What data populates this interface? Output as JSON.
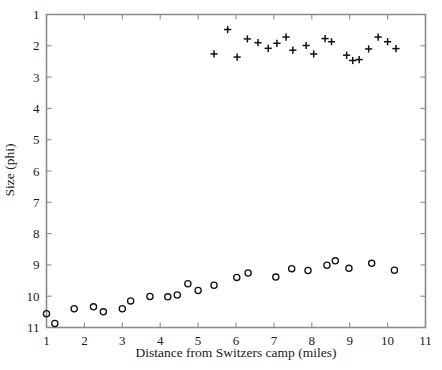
{
  "chart_data": {
    "type": "scatter",
    "title": "",
    "xlabel": "Distance from Switzers camp (miles)",
    "ylabel": "Size (phi)",
    "xlim": [
      1,
      11
    ],
    "ylim": [
      1,
      11
    ],
    "y_inverted": true,
    "grid": false,
    "legend": "none",
    "xticks": [
      1,
      2,
      3,
      4,
      5,
      6,
      7,
      8,
      9,
      10,
      11
    ],
    "xtick_labels": [
      "1",
      "2",
      "3",
      "4",
      "5",
      "6",
      "7",
      "8",
      "9",
      "10",
      "11"
    ],
    "yticks": [
      1,
      2,
      3,
      4,
      5,
      6,
      7,
      8,
      9,
      10,
      11
    ],
    "ytick_labels": [
      "1",
      "2",
      "3",
      "4",
      "5",
      "6",
      "7",
      "8",
      "9",
      "10",
      "11"
    ],
    "series": [
      {
        "name": "coarse-fraction-plus",
        "marker": "plus",
        "color": "#111111",
        "points": [
          [
            5.42,
            2.26
          ],
          [
            5.78,
            1.48
          ],
          [
            6.03,
            2.36
          ],
          [
            6.3,
            1.78
          ],
          [
            6.58,
            1.9
          ],
          [
            6.85,
            2.08
          ],
          [
            7.08,
            1.92
          ],
          [
            7.32,
            1.72
          ],
          [
            7.5,
            2.14
          ],
          [
            7.85,
            1.99
          ],
          [
            8.05,
            2.26
          ],
          [
            8.35,
            1.77
          ],
          [
            8.52,
            1.87
          ],
          [
            8.92,
            2.3
          ],
          [
            9.08,
            2.47
          ],
          [
            9.25,
            2.44
          ],
          [
            9.5,
            2.1
          ],
          [
            9.75,
            1.72
          ],
          [
            10.0,
            1.87
          ],
          [
            10.22,
            2.09
          ]
        ]
      },
      {
        "name": "fine-fraction-circle",
        "marker": "circle",
        "color": "#111111",
        "points": [
          [
            1.0,
            10.56
          ],
          [
            1.22,
            10.87
          ],
          [
            1.73,
            10.4
          ],
          [
            2.24,
            10.34
          ],
          [
            2.5,
            10.5
          ],
          [
            3.0,
            10.4
          ],
          [
            3.22,
            10.15
          ],
          [
            3.73,
            10.01
          ],
          [
            4.2,
            10.02
          ],
          [
            4.45,
            9.96
          ],
          [
            4.73,
            9.6
          ],
          [
            5.0,
            9.82
          ],
          [
            5.42,
            9.65
          ],
          [
            6.02,
            9.4
          ],
          [
            6.32,
            9.26
          ],
          [
            7.05,
            9.39
          ],
          [
            7.47,
            9.12
          ],
          [
            7.9,
            9.18
          ],
          [
            8.4,
            9.01
          ],
          [
            8.62,
            8.87
          ],
          [
            8.98,
            9.11
          ],
          [
            9.58,
            8.95
          ],
          [
            10.18,
            9.17
          ]
        ]
      }
    ]
  }
}
